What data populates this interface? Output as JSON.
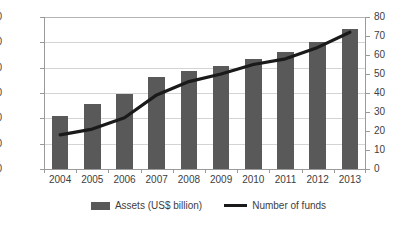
{
  "chart_data": {
    "type": "bar",
    "title": "",
    "subtitle": "",
    "xlabel": "",
    "ylabel": "",
    "grid": true,
    "legend_position": "bottom-center",
    "categories": [
      "2004",
      "2005",
      "2006",
      "2007",
      "2008",
      "2009",
      "2010",
      "2011",
      "2012",
      "2013"
    ],
    "series": [
      {
        "name": "Assets (US$ billion)",
        "type": "bar",
        "axis": "left",
        "color": "#595959",
        "values": [
          420,
          510,
          590,
          730,
          770,
          810,
          870,
          920,
          1000,
          1105
        ]
      },
      {
        "name": "Number of funds",
        "type": "line",
        "axis": "right",
        "color": "#1a1a1a",
        "values": [
          18,
          21,
          27,
          39,
          46,
          50,
          55,
          58,
          64,
          72
        ]
      }
    ],
    "axes": {
      "left": {
        "min": 0,
        "max": 1200,
        "step": 200,
        "ticks": [
          "0",
          "200",
          "400",
          "600",
          "800",
          "1000",
          "1200"
        ]
      },
      "right": {
        "min": 0,
        "max": 80,
        "step": 10,
        "ticks": [
          "0",
          "10",
          "20",
          "30",
          "40",
          "50",
          "60",
          "70",
          "80"
        ]
      }
    }
  },
  "legend": {
    "items": [
      {
        "label": "Assets (US$ billion)",
        "marker": "bar-swatch-icon"
      },
      {
        "label": "Number of funds",
        "marker": "line-swatch-icon"
      }
    ]
  }
}
